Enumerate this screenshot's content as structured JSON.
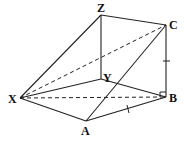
{
  "diagram": {
    "type": "3d-prism",
    "vertices": {
      "Z": {
        "label": "Z",
        "x": 101,
        "y": 15,
        "lx": 101,
        "ly": 9
      },
      "C": {
        "label": "C",
        "x": 166,
        "y": 25,
        "lx": 174,
        "ly": 28
      },
      "Y": {
        "label": "Y",
        "x": 101,
        "y": 79,
        "lx": 107,
        "ly": 78
      },
      "X": {
        "label": "X",
        "x": 20,
        "y": 98,
        "lx": 12,
        "ly": 102
      },
      "B": {
        "label": "B",
        "x": 166,
        "y": 97,
        "lx": 173,
        "ly": 102
      },
      "A": {
        "label": "A",
        "x": 86,
        "y": 121,
        "lx": 85,
        "ly": 133
      }
    },
    "solid_edges": [
      [
        "Z",
        "C"
      ],
      [
        "Z",
        "Y"
      ],
      [
        "Z",
        "X"
      ],
      [
        "C",
        "B"
      ],
      [
        "C",
        "A"
      ],
      [
        "X",
        "Y"
      ],
      [
        "Y",
        "B"
      ],
      [
        "X",
        "A"
      ],
      [
        "A",
        "B"
      ]
    ],
    "dashed_edges": [
      [
        "X",
        "C"
      ],
      [
        "X",
        "B"
      ]
    ],
    "right_angle_at": "B",
    "tick_marks": [
      [
        "C",
        "B"
      ],
      [
        "A",
        "B"
      ]
    ],
    "stroke_color": "#222222"
  }
}
